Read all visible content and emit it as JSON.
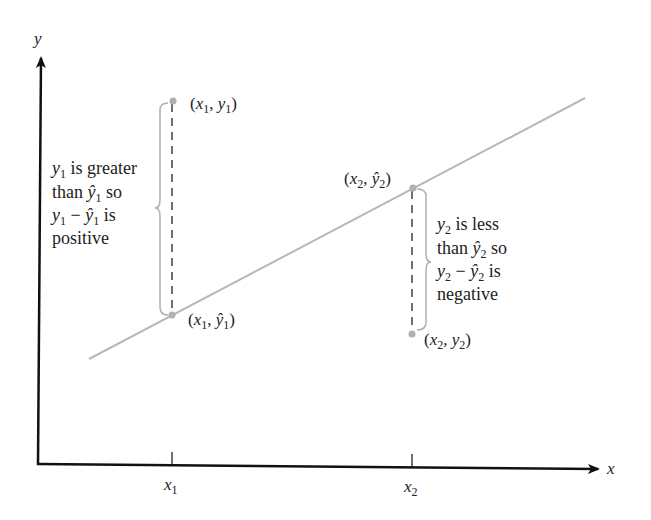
{
  "diagram": {
    "type": "regression-residuals",
    "axes": {
      "x_label": "x",
      "y_label": "y",
      "x_ticks": [
        {
          "base": "x",
          "sub": "1"
        },
        {
          "base": "x",
          "sub": "2"
        }
      ]
    },
    "points": {
      "p1_observed": {
        "label_base1": "x",
        "sub1": "1",
        "label_base2": "y",
        "sub2": "1",
        "hat": false
      },
      "p1_predicted": {
        "label_base1": "x",
        "sub1": "1",
        "label_base2": "ŷ",
        "sub2": "1",
        "hat": true
      },
      "p2_predicted": {
        "label_base1": "x",
        "sub1": "2",
        "label_base2": "ŷ",
        "sub2": "2",
        "hat": true
      },
      "p2_observed": {
        "label_base1": "x",
        "sub1": "2",
        "label_base2": "y",
        "sub2": "2",
        "hat": false
      }
    },
    "annotations": {
      "left": {
        "line1_var": "y",
        "line1_sub": "1",
        "line1_rest": " is greater",
        "line2_pre": "than ",
        "line2_var": "ŷ",
        "line2_sub": "1",
        "line2_rest": " so",
        "line3_var1": "y",
        "line3_sub1": "1",
        "line3_op": " − ",
        "line3_var2": "ŷ",
        "line3_sub2": "1",
        "line3_rest": " is",
        "line4": "positive"
      },
      "right": {
        "line1_var": "y",
        "line1_sub": "2",
        "line1_rest": " is less",
        "line2_pre": "than ",
        "line2_var": "ŷ",
        "line2_sub": "2",
        "line2_rest": " so",
        "line3_var1": "y",
        "line3_sub1": "2",
        "line3_op": " − ",
        "line3_var2": "ŷ",
        "line3_sub2": "2",
        "line3_rest": " is",
        "line4": "negative"
      }
    },
    "colors": {
      "axis": "#111111",
      "regression_line": "#b8b8b8",
      "brace": "#b0b0b0",
      "dashed": "#222222",
      "point": "#b0b0b0",
      "text": "#222222"
    }
  }
}
